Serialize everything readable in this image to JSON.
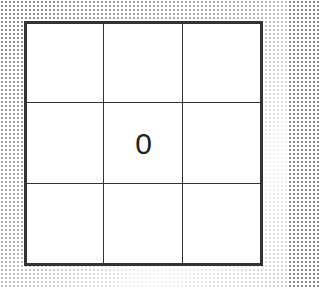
{
  "board": {
    "rows": 3,
    "cols": 3,
    "cells": [
      "",
      "",
      "",
      "",
      "0",
      "",
      "",
      "",
      ""
    ]
  },
  "colors": {
    "grid_line": "#333333",
    "cell_bg": "#ffffff",
    "mark": "#222222"
  }
}
